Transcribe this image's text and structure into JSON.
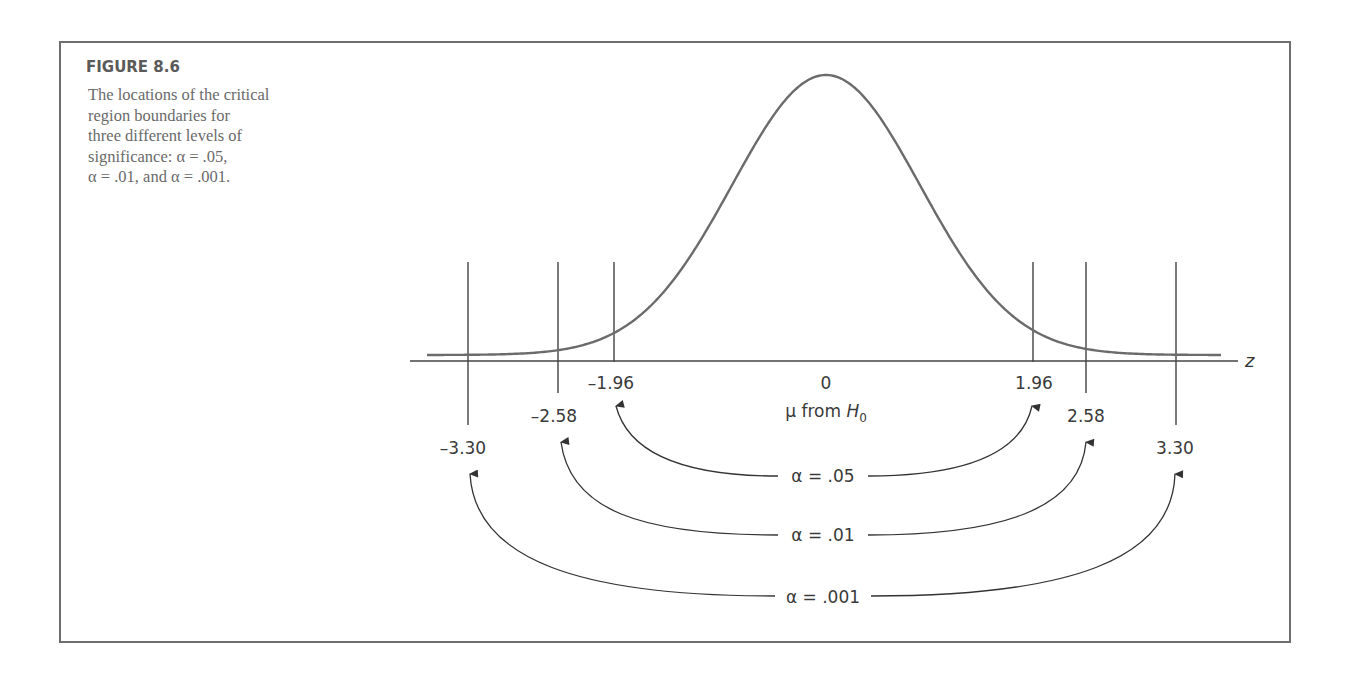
{
  "figure": {
    "title": "FIGURE 8.6",
    "caption_lines": [
      "The locations of the critical",
      "region boundaries for",
      "three different levels of",
      "significance: α = .05,",
      "α = .01, and α = .001."
    ]
  },
  "chart_data": {
    "type": "line",
    "title": "FIGURE 8.6",
    "subtitle": "The locations of the critical region boundaries for three different levels of significance: α = .05, α = .01, and α = .001.",
    "xlabel": "z",
    "ylabel": "",
    "center_label": "0",
    "center_sublabel": "μ from",
    "center_sublabel_var": "H",
    "center_sublabel_sub": "0",
    "xlim": [
      -4,
      4
    ],
    "grid": false,
    "legend": null,
    "curve": {
      "distribution": "normal",
      "mean": 0,
      "sd": 1
    },
    "critical_values": [
      {
        "alpha": ".05",
        "label": "α = .05",
        "lower": -1.96,
        "upper": 1.96,
        "lower_label": "–1.96",
        "upper_label": "1.96"
      },
      {
        "alpha": ".01",
        "label": "α = .01",
        "lower": -2.58,
        "upper": 2.58,
        "lower_label": "–2.58",
        "upper_label": "2.58"
      },
      {
        "alpha": ".001",
        "label": "α = .001",
        "lower": -3.3,
        "upper": 3.3,
        "lower_label": "–3.30",
        "upper_label": "3.30"
      }
    ],
    "colors": {
      "curve": "#6b6b6b",
      "lines": "#333333",
      "frame": "#6e6e6e",
      "text": "#3a3a3a"
    }
  }
}
